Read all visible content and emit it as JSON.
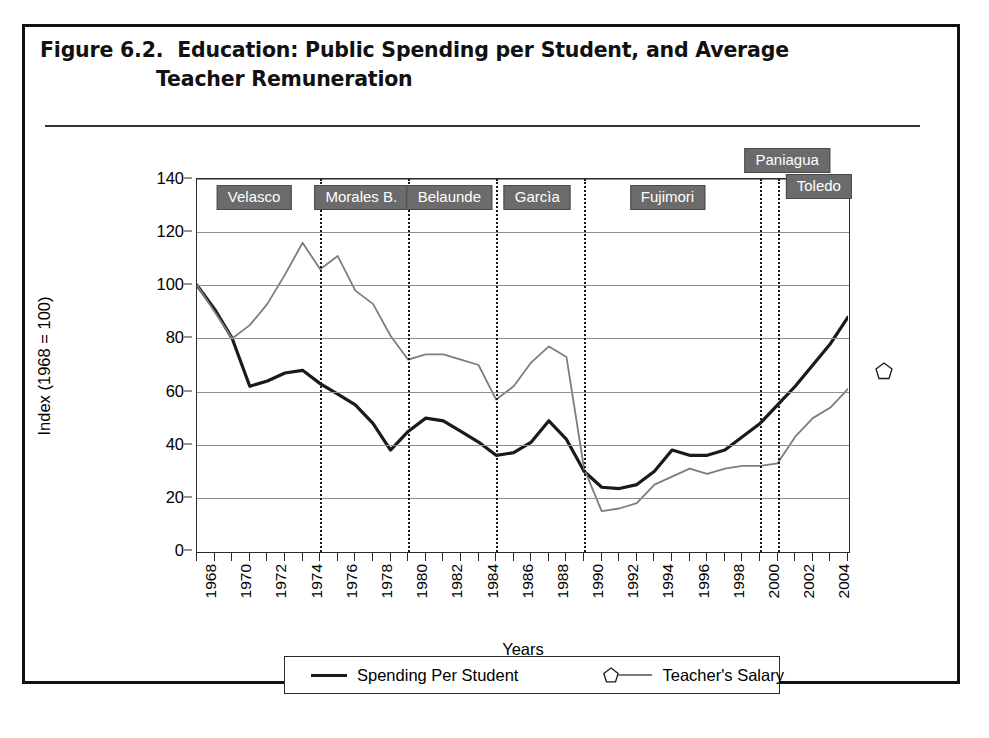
{
  "figure": {
    "title_line_1": "Figure 6.2.  Education: Public Spending per Student, and Average",
    "title_line_2": "Teacher Remuneration"
  },
  "axes": {
    "y_title": "Index (1968 = 100)",
    "x_title": "Years",
    "y_ticks": [
      0,
      20,
      40,
      60,
      80,
      100,
      120,
      140
    ],
    "x_ticks": [
      "1968",
      "1970",
      "1972",
      "1974",
      "1976",
      "1978",
      "1980",
      "1982",
      "1984",
      "1986",
      "1988",
      "1990",
      "1992",
      "1994",
      "1996",
      "1998",
      "2000",
      "2002",
      "2004"
    ]
  },
  "legend": {
    "spending_label": "Spending Per Student",
    "salary_label": "Teacher's Salary",
    "spending_color": "#1a1a1a",
    "salary_color": "#7d7d7d",
    "salary_marker": "pentagon"
  },
  "governments": [
    {
      "name": "Velasco",
      "start": 1968,
      "end": 1975,
      "label_center": 1971.3,
      "row": "in-plot"
    },
    {
      "name": "Morales B.",
      "start": 1975,
      "end": 1980,
      "label_center": 1977.4,
      "row": "in-plot"
    },
    {
      "name": "Belaunde",
      "start": 1980,
      "end": 1985,
      "label_center": 1982.4,
      "row": "in-plot"
    },
    {
      "name": "Garcìa",
      "start": 1985,
      "end": 1990,
      "label_center": 1987.4,
      "row": "in-plot"
    },
    {
      "name": "Fujimori",
      "start": 1990,
      "end": 2000,
      "label_center": 1994.8,
      "row": "in-plot"
    },
    {
      "name": "Paniagua",
      "start": 2000,
      "end": 2001,
      "label_center": 2001.6,
      "row": "above-plot"
    },
    {
      "name": "Toledo",
      "start": 2001,
      "end": 2005,
      "label_center": 2003.4,
      "row": "top-edge"
    }
  ],
  "government_dividers": [
    1975,
    1980,
    1985,
    1990,
    2000,
    2001
  ],
  "chart_data": {
    "type": "line",
    "title": "Education: Public Spending per Student, and Average Teacher Remuneration",
    "xlabel": "Years",
    "ylabel": "Index (1968 = 100)",
    "xlim": [
      1968,
      2005
    ],
    "ylim": [
      0,
      140
    ],
    "grid": true,
    "legend_position": "bottom",
    "x": [
      1968,
      1969,
      1970,
      1971,
      1972,
      1973,
      1974,
      1975,
      1976,
      1977,
      1978,
      1979,
      1980,
      1981,
      1982,
      1983,
      1984,
      1985,
      1986,
      1987,
      1988,
      1989,
      1990,
      1991,
      1992,
      1993,
      1994,
      1995,
      1996,
      1997,
      1998,
      1999,
      2000,
      2001,
      2002,
      2003,
      2004,
      2005
    ],
    "series": [
      {
        "name": "Spending Per Student",
        "color": "#1a1a1a",
        "values": [
          100,
          91,
          80,
          62,
          64,
          67,
          68,
          63,
          59,
          55,
          48,
          38,
          45,
          50,
          49,
          45,
          41,
          36,
          37,
          41,
          49,
          42,
          30,
          24,
          23.5,
          25,
          30,
          38,
          36,
          36,
          38,
          43,
          48,
          55,
          62,
          70,
          78,
          88
        ]
      },
      {
        "name": "Teacher's Salary",
        "color": "#7d7d7d",
        "values": [
          100,
          90,
          80,
          85,
          93,
          104,
          116,
          106,
          111,
          98,
          93,
          81,
          72,
          74,
          74,
          72,
          70,
          57,
          62,
          71,
          77,
          73,
          31,
          15,
          16,
          18,
          25,
          28,
          31,
          29,
          31,
          32,
          32,
          33,
          43,
          50,
          54,
          61
        ]
      }
    ]
  }
}
